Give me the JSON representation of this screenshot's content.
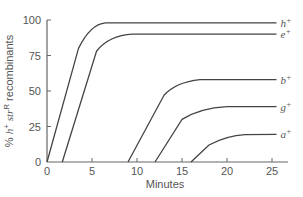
{
  "chart_data": {
    "type": "line",
    "title": "",
    "xlabel": "Minutes",
    "ylabel": "% h+ strR recombinants",
    "ylabel_parts": {
      "pre": "% ",
      "h": "h",
      "hsup": "+",
      "str": " str",
      "strsup": "R",
      "post": " recombinants"
    },
    "xlim": [
      0,
      26.5
    ],
    "ylim": [
      0,
      100
    ],
    "xticks": [
      0,
      5,
      10,
      15,
      20,
      25
    ],
    "yticks": [
      0,
      25,
      50,
      75,
      100
    ],
    "grid": false,
    "legend": "inline-right",
    "series": [
      {
        "name": "h+",
        "base": "h",
        "points": [
          [
            0,
            0
          ],
          [
            3.5,
            80
          ],
          [
            4.5,
            93
          ],
          [
            5.5,
            97.5
          ],
          [
            6.5,
            98
          ],
          [
            25.5,
            98
          ]
        ]
      },
      {
        "name": "e+",
        "base": "e",
        "points": [
          [
            1.7,
            0
          ],
          [
            5.5,
            78
          ],
          [
            6.5,
            86
          ],
          [
            8,
            89.5
          ],
          [
            9.5,
            90
          ],
          [
            25.5,
            90
          ]
        ]
      },
      {
        "name": "b+",
        "base": "b",
        "points": [
          [
            9,
            0
          ],
          [
            13,
            47
          ],
          [
            14,
            54
          ],
          [
            15.5,
            57
          ],
          [
            17,
            58
          ],
          [
            25.5,
            58
          ]
        ]
      },
      {
        "name": "g+",
        "base": "g",
        "points": [
          [
            12,
            0
          ],
          [
            15,
            30
          ],
          [
            16.5,
            36
          ],
          [
            18.5,
            38.5
          ],
          [
            20,
            39
          ],
          [
            25.5,
            39
          ]
        ]
      },
      {
        "name": "a+",
        "base": "a",
        "points": [
          [
            16,
            0
          ],
          [
            18,
            12
          ],
          [
            19.5,
            17
          ],
          [
            21,
            19
          ],
          [
            22,
            19.3
          ],
          [
            25.5,
            19.5
          ]
        ]
      }
    ]
  },
  "colors": {
    "line": "#444444",
    "axis": "#666666",
    "text": "#555555"
  }
}
